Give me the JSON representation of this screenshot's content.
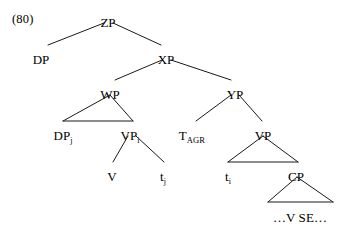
{
  "figure": {
    "example_number": "(80)",
    "type": "syntax-tree",
    "line_color": "#1a1a1a",
    "text_color": "#000000",
    "background_color": "#ffffff"
  },
  "nodes": {
    "zp": {
      "label": "ZP",
      "x": 108,
      "y": 16
    },
    "dp": {
      "label": "DP",
      "x": 41,
      "y": 53
    },
    "xp": {
      "label": "XP",
      "x": 166,
      "y": 53
    },
    "wp": {
      "label": "WP",
      "x": 110,
      "y": 88
    },
    "yp": {
      "label": "YP",
      "x": 235,
      "y": 88
    },
    "dp_j": {
      "label": "DP",
      "sub": "j",
      "x": 63,
      "y": 129
    },
    "vp_i": {
      "label": "VP",
      "sub": "i",
      "x": 130,
      "y": 129
    },
    "t_agr": {
      "label": "T",
      "sub": "AGR",
      "x": 192,
      "y": 129
    },
    "vp": {
      "label": "VP",
      "x": 263,
      "y": 129
    },
    "v": {
      "label": "V",
      "x": 112,
      "y": 170
    },
    "t_j": {
      "label": "t",
      "sub": "j",
      "x": 163,
      "y": 170
    },
    "t_i": {
      "label": "t",
      "sub": "i",
      "x": 228,
      "y": 170
    },
    "cp": {
      "label": "CP",
      "x": 296,
      "y": 170
    },
    "vse": {
      "label": "…V SE…",
      "x": 300,
      "y": 211
    }
  },
  "branches": [
    {
      "from": "ZP",
      "to": "DP",
      "kind": "line"
    },
    {
      "from": "ZP",
      "to": "XP",
      "kind": "line"
    },
    {
      "from": "XP",
      "to": "WP",
      "kind": "line"
    },
    {
      "from": "XP",
      "to": "YP",
      "kind": "line"
    },
    {
      "from": "WP",
      "to": "DPj",
      "kind": "triangle"
    },
    {
      "from": "WP",
      "to": "VPi",
      "kind": "triangle"
    },
    {
      "from": "YP",
      "to": "TAGR",
      "kind": "line"
    },
    {
      "from": "YP",
      "to": "VP",
      "kind": "line"
    },
    {
      "from": "VPi",
      "to": "V",
      "kind": "line"
    },
    {
      "from": "VPi",
      "to": "tj",
      "kind": "line"
    },
    {
      "from": "VP",
      "to": "ti",
      "kind": "triangle"
    },
    {
      "from": "VP",
      "to": "CP",
      "kind": "triangle"
    },
    {
      "from": "CP",
      "to": "VSE",
      "kind": "triangle"
    }
  ]
}
